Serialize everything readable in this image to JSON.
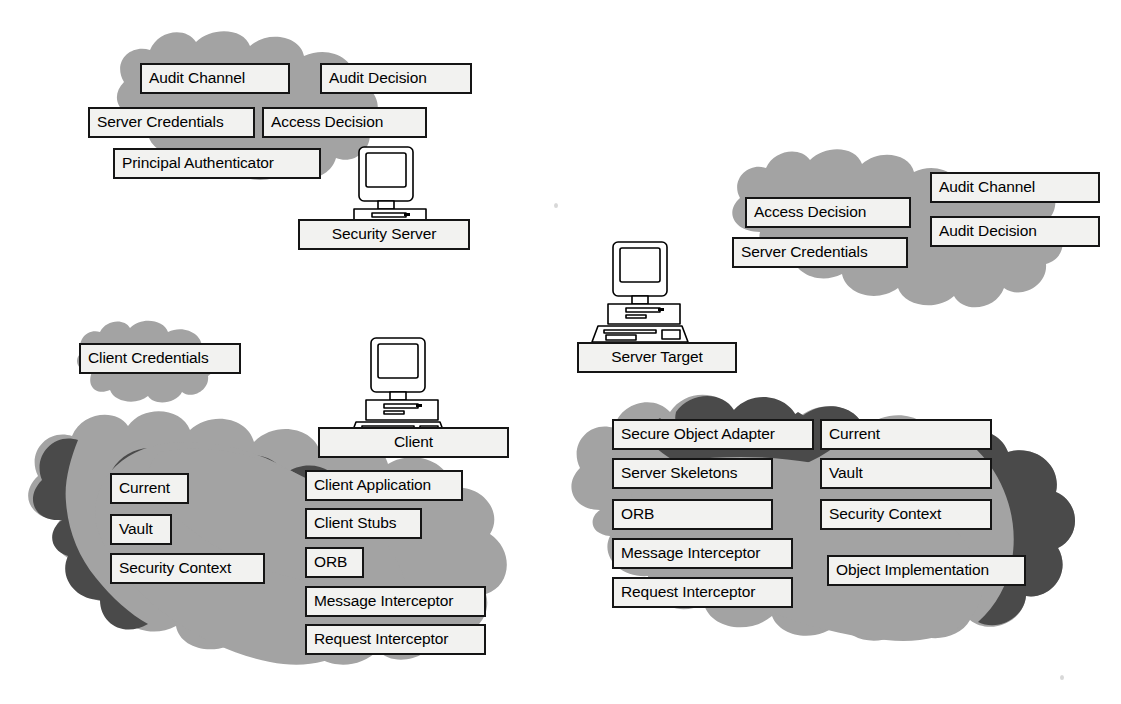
{
  "diagram": {
    "colors": {
      "cloud_light": "#a3a3a3",
      "cloud_dark": "#4a4a4a",
      "box_fill": "#f2f2f0",
      "box_border": "#151515",
      "text": "#000000",
      "background": "#ffffff"
    }
  },
  "regions": {
    "security_server_cloud": {
      "name": "Security Server Environment",
      "labels": [
        {
          "id": "audit-channel",
          "text": "Audit Channel",
          "x": 140,
          "y": 63,
          "w": 150,
          "align": "left"
        },
        {
          "id": "audit-decision",
          "text": "Audit Decision",
          "x": 320,
          "y": 63,
          "w": 152,
          "align": "left"
        },
        {
          "id": "server-credentials",
          "text": "Server Credentials",
          "x": 88,
          "y": 107,
          "w": 167,
          "align": "left"
        },
        {
          "id": "access-decision",
          "text": "Access Decision",
          "x": 262,
          "y": 107,
          "w": 165,
          "align": "left"
        },
        {
          "id": "principal-authenticator",
          "text": "Principal Authenticator",
          "x": 113,
          "y": 148,
          "w": 208,
          "align": "left"
        }
      ]
    },
    "security_server_node": {
      "name": "Security Server",
      "computer": {
        "x": 334,
        "y": 143
      },
      "label": {
        "id": "security-server",
        "text": "Security Server",
        "x": 298,
        "y": 219,
        "w": 172,
        "align": "center"
      }
    },
    "server_env_cloud": {
      "name": "Server Security Environment",
      "labels": [
        {
          "id": "access-decision-2",
          "text": "Access Decision",
          "x": 745,
          "y": 197,
          "w": 166,
          "align": "left"
        },
        {
          "id": "audit-channel-2",
          "text": "Audit Channel",
          "x": 930,
          "y": 172,
          "w": 170,
          "align": "left"
        },
        {
          "id": "audit-decision-2",
          "text": "Audit Decision",
          "x": 930,
          "y": 216,
          "w": 170,
          "align": "left"
        },
        {
          "id": "server-credentials-2",
          "text": "Server Credentials",
          "x": 732,
          "y": 237,
          "w": 176,
          "align": "left"
        }
      ]
    },
    "server_target_node": {
      "name": "Server Target",
      "computer": {
        "x": 588,
        "y": 238
      },
      "label": {
        "id": "server-target",
        "text": "Server Target",
        "x": 577,
        "y": 342,
        "w": 160,
        "align": "center"
      }
    },
    "client_credentials_cloud": {
      "name": "Client Credentials Cloud",
      "labels": [
        {
          "id": "client-credentials",
          "text": "Client Credentials",
          "x": 79,
          "y": 343,
          "w": 162,
          "align": "left"
        }
      ]
    },
    "client_node": {
      "name": "Client",
      "computer": {
        "x": 346,
        "y": 334
      },
      "label": {
        "id": "client",
        "text": "Client",
        "x": 318,
        "y": 427,
        "w": 191,
        "align": "center"
      }
    },
    "client_cloud": {
      "name": "Client Environment",
      "labels": [
        {
          "id": "client-current",
          "text": "Current",
          "x": 110,
          "y": 473,
          "w": 79,
          "align": "left"
        },
        {
          "id": "client-vault",
          "text": "Vault",
          "x": 110,
          "y": 514,
          "w": 62,
          "align": "left"
        },
        {
          "id": "client-security-context",
          "text": "Security Context",
          "x": 110,
          "y": 553,
          "w": 155,
          "align": "left"
        },
        {
          "id": "client-application",
          "text": "Client Application",
          "x": 305,
          "y": 470,
          "w": 158,
          "align": "left"
        },
        {
          "id": "client-stubs",
          "text": "Client Stubs",
          "x": 305,
          "y": 508,
          "w": 117,
          "align": "left"
        },
        {
          "id": "client-orb",
          "text": "ORB",
          "x": 305,
          "y": 547,
          "w": 59,
          "align": "left"
        },
        {
          "id": "client-message-interceptor",
          "text": "Message Interceptor",
          "x": 305,
          "y": 586,
          "w": 181,
          "align": "left"
        },
        {
          "id": "client-request-interceptor",
          "text": "Request Interceptor",
          "x": 305,
          "y": 624,
          "w": 181,
          "align": "left"
        }
      ]
    },
    "server_cloud": {
      "name": "Server Environment",
      "labels": [
        {
          "id": "secure-object-adapter",
          "text": "Secure Object Adapter",
          "x": 612,
          "y": 419,
          "w": 202,
          "align": "left"
        },
        {
          "id": "server-skeletons",
          "text": "Server Skeletons",
          "x": 612,
          "y": 458,
          "w": 161,
          "align": "left"
        },
        {
          "id": "server-orb",
          "text": "ORB",
          "x": 612,
          "y": 499,
          "w": 161,
          "align": "left"
        },
        {
          "id": "server-message-interceptor",
          "text": "Message Interceptor",
          "x": 612,
          "y": 538,
          "w": 181,
          "align": "left"
        },
        {
          "id": "server-request-interceptor",
          "text": "Request Interceptor",
          "x": 612,
          "y": 577,
          "w": 181,
          "align": "left"
        },
        {
          "id": "server-current",
          "text": "Current",
          "x": 820,
          "y": 419,
          "w": 172,
          "align": "left"
        },
        {
          "id": "server-vault",
          "text": "Vault",
          "x": 820,
          "y": 458,
          "w": 172,
          "align": "left"
        },
        {
          "id": "server-security-context",
          "text": "Security Context",
          "x": 820,
          "y": 499,
          "w": 172,
          "align": "left"
        },
        {
          "id": "object-implementation",
          "text": "Object Implementation",
          "x": 827,
          "y": 555,
          "w": 199,
          "align": "left"
        }
      ]
    }
  }
}
